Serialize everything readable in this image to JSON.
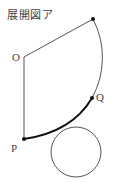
{
  "figure": {
    "title": "展開図ア",
    "labels": {
      "O": "O",
      "P": "P",
      "Q": "Q"
    },
    "points": {
      "O": [
        24,
        57
      ],
      "A": [
        93,
        19
      ],
      "P": [
        24,
        139
      ],
      "Q": [
        92,
        98
      ]
    },
    "circle": {
      "cx": 76,
      "cy": 152,
      "r": 25
    },
    "colors": {
      "line": "#555555",
      "thick": "#111111",
      "text": "#444444"
    }
  }
}
